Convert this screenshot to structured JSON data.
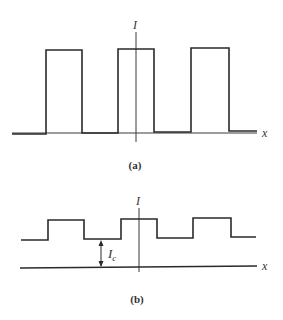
{
  "figure": {
    "panel_a": {
      "caption": "(a)",
      "y_axis_label": "I",
      "x_axis_label": "x",
      "description": "Square-wave intensity pattern dropping to zero between pulses",
      "baseline_level": 0,
      "pulses": 3
    },
    "panel_b": {
      "caption": "(b)",
      "y_axis_label": "I",
      "x_axis_label": "x",
      "offset_label": "I",
      "offset_subscript": "c",
      "description": "Square-wave intensity pattern riding on a constant offset I_c",
      "pulses": 3
    }
  },
  "colors": {
    "line": "#2a2a2a",
    "text": "#333333",
    "background": "#ffffff"
  }
}
